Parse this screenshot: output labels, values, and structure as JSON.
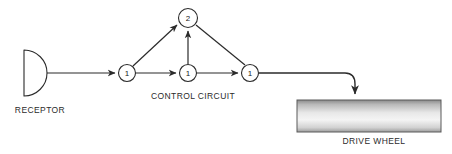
{
  "diagram": {
    "stroke_color": "#2b2b2b",
    "text_color": "#2b2b2b",
    "background_color": "#ffffff",
    "receptor": {
      "shape_name": "half-disc",
      "caption": "RECEPTOR"
    },
    "control_circuit": {
      "caption": "CONTROL CIRCUIT",
      "nodes": [
        {
          "id": "node-1a",
          "label": "1",
          "cx": 127,
          "cy": 73,
          "r": 8.5
        },
        {
          "id": "node-1b",
          "label": "1",
          "cx": 188,
          "cy": 73,
          "r": 8.5
        },
        {
          "id": "node-1c",
          "label": "1",
          "cx": 250,
          "cy": 73,
          "r": 8.5
        },
        {
          "id": "node-2",
          "label": "2",
          "cx": 188,
          "cy": 18,
          "r": 9.5
        }
      ]
    },
    "drive_wheel": {
      "caption": "DRIVE WHEEL",
      "fill_top_color": "#8c8c8c",
      "fill_mid_color": "#f2f2f2",
      "fill_bottom_color": "#9a9a9a",
      "border_color": "#555555"
    },
    "edges": [
      {
        "id": "edge-receptor-to-node1a",
        "from": "receptor",
        "to": "node-1a",
        "arrow": true
      },
      {
        "id": "edge-node1a-to-node1b",
        "from": "node-1a",
        "to": "node-1b",
        "arrow": true
      },
      {
        "id": "edge-node1b-to-node1c",
        "from": "node-1b",
        "to": "node-1c",
        "arrow": true
      },
      {
        "id": "edge-node1a-to-node2",
        "from": "node-1a",
        "to": "node-2",
        "arrow": true
      },
      {
        "id": "edge-node1b-to-node2",
        "from": "node-1b",
        "to": "node-2",
        "arrow": true
      },
      {
        "id": "edge-node1c-to-node2",
        "from": "node-1c",
        "to": "node-2",
        "arrow": true
      },
      {
        "id": "edge-node1c-to-drive-wheel",
        "from": "node-1c",
        "to": "drive-wheel",
        "arrow": true
      }
    ]
  }
}
